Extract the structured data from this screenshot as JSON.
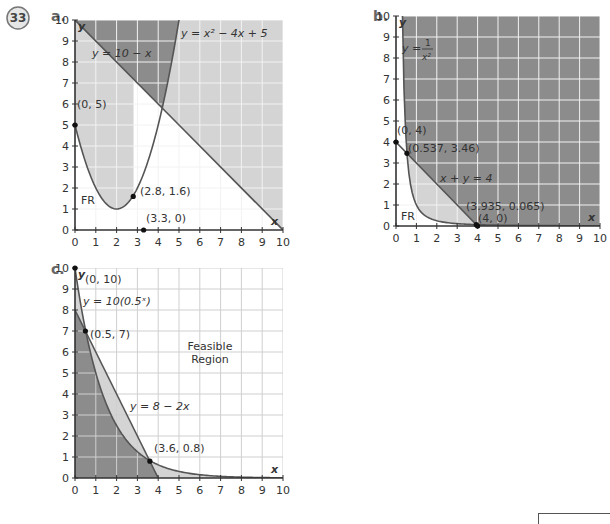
{
  "problem_number": "33",
  "colors": {
    "dark_region": "#8c8c8c",
    "light_region": "#d4d4d4",
    "feasible_region": "#ffffff",
    "grid": "#f2f2f2",
    "grid_on_white": "#cfcfcf",
    "curve": "#555555",
    "axis": "#333333"
  },
  "chart_data": [
    {
      "part": "a.",
      "type": "line",
      "title": "",
      "xlabel": "x",
      "ylabel": "y",
      "xlim": [
        0,
        10
      ],
      "ylim": [
        0,
        10
      ],
      "grid": true,
      "xticks": [
        0,
        1,
        2,
        3,
        4,
        5,
        6,
        7,
        8,
        9,
        10
      ],
      "yticks": [
        0,
        1,
        2,
        3,
        4,
        5,
        6,
        7,
        8,
        9,
        10
      ],
      "series": [
        {
          "name": "y = 10 − x",
          "function": "10 - x"
        },
        {
          "name": "y = x² − 4x + 5",
          "function": "x^2 - 4x + 5"
        }
      ],
      "points": [
        {
          "label": "(0, 5)",
          "x": 0,
          "y": 5
        },
        {
          "label": "(2.8, 1.6)",
          "x": 2.8,
          "y": 1.6
        },
        {
          "label": "(3.3, 0)",
          "x": 3.3,
          "y": 0
        }
      ],
      "annotations": [
        "y = 10 − x",
        "y = x² − 4x + 5",
        "FR"
      ],
      "regions": {
        "FR": "below parabola and below line y = 10 − x",
        "dark": "above both curves",
        "light": "remaining area"
      }
    },
    {
      "part": "b.",
      "type": "line",
      "title": "",
      "xlabel": "x",
      "ylabel": "y",
      "xlim": [
        0,
        10
      ],
      "ylim": [
        0,
        10
      ],
      "grid": true,
      "xticks": [
        0,
        1,
        2,
        3,
        4,
        5,
        6,
        7,
        8,
        9,
        10
      ],
      "yticks": [
        0,
        1,
        2,
        3,
        4,
        5,
        6,
        7,
        8,
        9,
        10
      ],
      "series": [
        {
          "name": "y = 1/x²",
          "function": "1 / x^2"
        },
        {
          "name": "x + y = 4",
          "function": "4 - x"
        }
      ],
      "points": [
        {
          "label": "(0, 4)",
          "x": 0,
          "y": 4
        },
        {
          "label": "(0.537, 3.46)",
          "x": 0.537,
          "y": 3.46
        },
        {
          "label": "(3.935, 0.065)",
          "x": 3.935,
          "y": 0.065
        },
        {
          "label": "(4, 0)",
          "x": 4,
          "y": 0
        }
      ],
      "annotations": [
        "y = 1/x²",
        "x + y = 4",
        "FR"
      ],
      "regions": {
        "FR": "below y = 1/x² and below x + y = 4",
        "dark": "above x + y = 4",
        "light": "between curves"
      }
    },
    {
      "part": "c.",
      "type": "line",
      "title": "",
      "xlabel": "x",
      "ylabel": "y",
      "xlim": [
        0,
        10
      ],
      "ylim": [
        0,
        10
      ],
      "grid": true,
      "xticks": [
        0,
        1,
        2,
        3,
        4,
        5,
        6,
        7,
        8,
        9,
        10
      ],
      "yticks": [
        0,
        1,
        2,
        3,
        4,
        5,
        6,
        7,
        8,
        9,
        10
      ],
      "series": [
        {
          "name": "y = 10(0.5^x)",
          "function": "10 * 0.5^x"
        },
        {
          "name": "y = 8 − 2x",
          "function": "8 - 2x"
        }
      ],
      "points": [
        {
          "label": "(0, 10)",
          "x": 0,
          "y": 10
        },
        {
          "label": "(0.5, 7)",
          "x": 0.5,
          "y": 7
        },
        {
          "label": "(3.6, 0.8)",
          "x": 3.6,
          "y": 0.8
        }
      ],
      "annotations": [
        "y = 10(0.5ˣ)",
        "y = 8 − 2x",
        "Feasible Region"
      ],
      "regions": {
        "feasible": "above both curves",
        "dark": "below both curves",
        "light": "between curves"
      }
    }
  ],
  "labels": {
    "a": {
      "part": "a.",
      "line": "y = 10 − x",
      "parabola": "y = x² − 4x + 5",
      "fr": "FR",
      "p1": "(0, 5)",
      "p2": "(2.8, 1.6)",
      "p3": "(3.3, 0)"
    },
    "b": {
      "part": "b.",
      "curve_lhs": "y =",
      "curve_num": "1",
      "curve_den": "x²",
      "line": "x + y = 4",
      "fr": "FR",
      "p1": "(0, 4)",
      "p2": "(0.537, 3.46)",
      "p3": "(3.935, 0.065)",
      "p4": "(4, 0)"
    },
    "c": {
      "part": "c.",
      "curve": "y = 10(0.5ˣ)",
      "line": "y = 8 − 2x",
      "fr1": "Feasible",
      "fr2": "Region",
      "p1": "(0, 10)",
      "p2": "(0.5, 7)",
      "p3": "(3.6, 0.8)"
    },
    "axis_x": "x",
    "axis_y": "y"
  }
}
